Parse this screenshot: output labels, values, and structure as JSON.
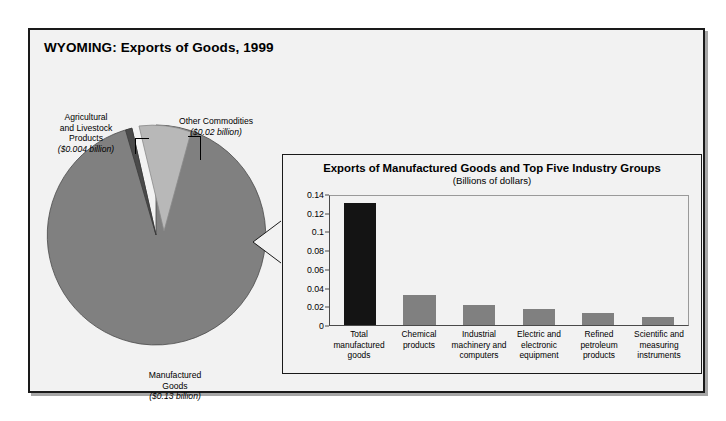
{
  "figure": {
    "title": "WYOMING: Exports of Goods, 1999"
  },
  "pie": {
    "labels": {
      "agricultural": {
        "name": "Agricultural\nand Livestock\nProducts",
        "amount": "($0.004 billion)"
      },
      "other": {
        "name": "Other Commodities",
        "amount": "($0.02 billion)"
      },
      "manufactured": {
        "name": "Manufactured\nGoods",
        "amount": "($0.13 billion)"
      }
    }
  },
  "inset": {
    "title": "Exports of Manufactured Goods and Top Five Industry Groups",
    "subtitle": "(Billions of dollars)"
  },
  "chart_data": [
    {
      "type": "pie",
      "title": "WYOMING: Exports of Goods, 1999",
      "unit": "billions of dollars",
      "categories": [
        "Manufactured Goods",
        "Other Commodities",
        "Agricultural and Livestock Products"
      ],
      "values": [
        0.13,
        0.02,
        0.004
      ],
      "labels": [
        "($0.13 billion)",
        "($0.02 billion)",
        "($0.004 billion)"
      ],
      "colors": [
        "#808080",
        "#b8b8b8",
        "#4a4a4a"
      ],
      "exploded": [
        "Other Commodities"
      ],
      "legend": "none"
    },
    {
      "type": "bar",
      "title": "Exports of Manufactured Goods and Top Five Industry Groups",
      "subtitle": "(Billions of dollars)",
      "xlabel": "",
      "ylabel": "",
      "categories": [
        "Total\nmanufactured\ngoods",
        "Chemical\nproducts",
        "Industrial\nmachinery and\ncomputers",
        "Electric and\nelectronic\nequipment",
        "Refined\npetroleum\nproducts",
        "Scientific and\nmeasuring\ninstruments"
      ],
      "values": [
        0.132,
        0.033,
        0.022,
        0.017,
        0.013,
        0.009
      ],
      "colors": [
        "#141414",
        "#808080",
        "#808080",
        "#808080",
        "#808080",
        "#808080"
      ],
      "ylim": [
        0,
        0.14
      ],
      "yticks": [
        0,
        0.02,
        0.04,
        0.06,
        0.08,
        0.1,
        0.12,
        0.14
      ],
      "ytick_labels": [
        "0",
        "0.02",
        "0.04",
        "0.06",
        "0.08",
        "0.1",
        "0.12",
        "0.14"
      ],
      "grid": false,
      "legend": "none"
    }
  ]
}
